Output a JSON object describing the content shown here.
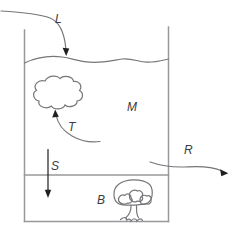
{
  "colors": {
    "background": "#ffffff",
    "tank_line": "#98989d",
    "sketch_line": "#76767a",
    "arrow_ink": "#1f1f1f",
    "label_ink": "#3c3c3c"
  },
  "diagram": {
    "labels": {
      "inflow": "L",
      "transfer": "T",
      "water_column": "M",
      "settling": "S",
      "outflow": "R",
      "bottom_layer": "B"
    },
    "shapes": {
      "container": "tank-outline",
      "surface": "water-surface-wave",
      "suspended_blob": "cloud-shape",
      "benthic_vegetation": "plant-shape"
    }
  }
}
